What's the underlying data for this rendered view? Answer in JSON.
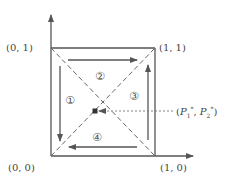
{
  "diagram": {
    "type": "unit-square-dynamics",
    "colors": {
      "line": "#555555",
      "dashed": "#666666",
      "dot": "#333333",
      "text": "#444444"
    },
    "corners": {
      "origin": "(0, 0)",
      "top_left": "(0, 1)",
      "top_right": "(1, 1)",
      "bottom_right": "(1, 0)"
    },
    "regions": [
      {
        "id": "1",
        "symbol": "①",
        "arrow_direction": "down"
      },
      {
        "id": "2",
        "symbol": "②",
        "arrow_direction": "right"
      },
      {
        "id": "3",
        "symbol": "③",
        "arrow_direction": "up"
      },
      {
        "id": "4",
        "symbol": "④",
        "arrow_direction": "left"
      }
    ],
    "equilibrium": {
      "open": "(",
      "p1": "P",
      "p1_sub": "1",
      "p1_sup": "*",
      "sep": ", ",
      "p2": "P",
      "p2_sub": "2",
      "p2_sup": "*",
      "close": ")"
    }
  }
}
